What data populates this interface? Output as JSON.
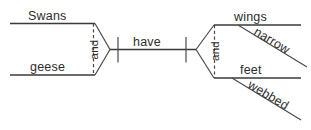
{
  "diagram": {
    "type": "reed-kellogg-sentence-diagram",
    "sentence": "Swans and geese have narrow wings and webbed feet",
    "subjects": {
      "first": "Swans",
      "second": "geese",
      "conjunction": "and"
    },
    "predicate": {
      "verb": "have"
    },
    "objects": {
      "first": "wings",
      "first_modifier": "narrow",
      "second": "feet",
      "second_modifier": "webbed",
      "conjunction": "and"
    },
    "colors": {
      "line": "#3a3a3a",
      "text": "#2e2e2e",
      "background": "#ffffff"
    }
  }
}
